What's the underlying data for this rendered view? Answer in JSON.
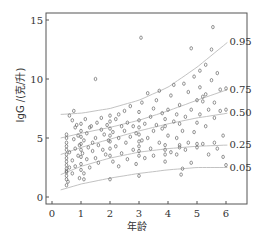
{
  "chart_data": {
    "type": "scatter",
    "title": "",
    "xlabel": "年龄",
    "ylabel": "IgG /(克/升)",
    "xlim": [
      -0.2,
      6.8
    ],
    "ylim": [
      -0.6,
      15.6
    ],
    "x_ticks": [
      0,
      1,
      2,
      3,
      4,
      5,
      6
    ],
    "y_ticks": [
      0,
      5,
      10,
      15
    ],
    "grid": false,
    "legend": null,
    "quantile_curves": [
      {
        "label": "0.95",
        "x": [
          0.3,
          1,
          2,
          3,
          4,
          5,
          6.05
        ],
        "y": [
          7.0,
          7.1,
          7.5,
          8.2,
          9.3,
          11.0,
          13.1
        ]
      },
      {
        "label": "0.75",
        "x": [
          0.3,
          1,
          2,
          3,
          4,
          5,
          6.05
        ],
        "y": [
          5.0,
          5.4,
          5.9,
          6.5,
          7.3,
          8.2,
          9.1
        ]
      },
      {
        "label": "0.50",
        "x": [
          0.3,
          1,
          2,
          3,
          4,
          5,
          6.05
        ],
        "y": [
          3.6,
          4.2,
          4.9,
          5.6,
          6.2,
          6.7,
          7.1
        ]
      },
      {
        "label": "0.25",
        "x": [
          0.3,
          1,
          2,
          3,
          4,
          5,
          6.05
        ],
        "y": [
          1.9,
          2.6,
          3.3,
          3.8,
          4.1,
          4.3,
          4.4
        ]
      },
      {
        "label": "0.05",
        "x": [
          0.3,
          1,
          2,
          3,
          4,
          5,
          6.05
        ],
        "y": [
          0.6,
          1.1,
          1.6,
          2.0,
          2.3,
          2.5,
          2.5
        ]
      }
    ],
    "points": [
      [
        0.5,
        1.0
      ],
      [
        0.5,
        1.5
      ],
      [
        0.5,
        1.8
      ],
      [
        0.5,
        2.1
      ],
      [
        0.5,
        2.4
      ],
      [
        0.5,
        2.7
      ],
      [
        0.5,
        3.0
      ],
      [
        0.5,
        3.3
      ],
      [
        0.5,
        3.6
      ],
      [
        0.5,
        4.0
      ],
      [
        0.5,
        4.3
      ],
      [
        0.5,
        4.6
      ],
      [
        0.5,
        5.0
      ],
      [
        0.5,
        5.3
      ],
      [
        0.5,
        2.2
      ],
      [
        0.55,
        1.3
      ],
      [
        0.6,
        2.5
      ],
      [
        0.6,
        3.8
      ],
      [
        0.6,
        6.9
      ],
      [
        0.7,
        6.5
      ],
      [
        0.7,
        3.1
      ],
      [
        0.7,
        2.0
      ],
      [
        0.75,
        4.9
      ],
      [
        0.75,
        7.3
      ],
      [
        0.8,
        5.9
      ],
      [
        0.8,
        4.1
      ],
      [
        0.8,
        2.6
      ],
      [
        0.85,
        6.1
      ],
      [
        0.9,
        3.5
      ],
      [
        0.9,
        5.2
      ],
      [
        0.95,
        4.4
      ],
      [
        0.95,
        1.6
      ],
      [
        1.0,
        2.3
      ],
      [
        1.0,
        2.8
      ],
      [
        1.0,
        3.4
      ],
      [
        1.0,
        4.0
      ],
      [
        1.0,
        4.5
      ],
      [
        1.0,
        5.1
      ],
      [
        1.0,
        5.6
      ],
      [
        1.0,
        6.2
      ],
      [
        1.05,
        3.7
      ],
      [
        1.1,
        1.5
      ],
      [
        1.1,
        2.0
      ],
      [
        1.1,
        4.8
      ],
      [
        1.15,
        6.6
      ],
      [
        1.2,
        5.4
      ],
      [
        1.2,
        3.2
      ],
      [
        1.25,
        4.2
      ],
      [
        1.3,
        5.9
      ],
      [
        1.3,
        2.5
      ],
      [
        1.35,
        6.0
      ],
      [
        1.4,
        3.9
      ],
      [
        1.4,
        4.6
      ],
      [
        1.5,
        5.0
      ],
      [
        1.5,
        10.0
      ],
      [
        1.5,
        3.3
      ],
      [
        1.55,
        6.3
      ],
      [
        1.6,
        4.4
      ],
      [
        1.6,
        2.9
      ],
      [
        1.7,
        5.7
      ],
      [
        1.7,
        6.7
      ],
      [
        1.75,
        4.0
      ],
      [
        1.8,
        5.3
      ],
      [
        1.85,
        3.6
      ],
      [
        1.9,
        6.1
      ],
      [
        1.95,
        4.8
      ],
      [
        2.0,
        1.5
      ],
      [
        2.0,
        3.5
      ],
      [
        2.0,
        4.1
      ],
      [
        2.0,
        4.7
      ],
      [
        2.0,
        5.2
      ],
      [
        2.0,
        5.8
      ],
      [
        2.0,
        6.4
      ],
      [
        2.0,
        6.9
      ],
      [
        2.1,
        3.0
      ],
      [
        2.1,
        5.5
      ],
      [
        2.2,
        6.6
      ],
      [
        2.2,
        4.3
      ],
      [
        2.3,
        7.0
      ],
      [
        2.3,
        5.0
      ],
      [
        2.3,
        2.6
      ],
      [
        2.4,
        6.0
      ],
      [
        2.4,
        3.7
      ],
      [
        2.5,
        7.3
      ],
      [
        2.5,
        5.6
      ],
      [
        2.55,
        4.6
      ],
      [
        2.6,
        3.2
      ],
      [
        2.6,
        6.3
      ],
      [
        2.7,
        5.1
      ],
      [
        2.7,
        7.7
      ],
      [
        2.8,
        4.0
      ],
      [
        2.8,
        6.0
      ],
      [
        2.9,
        5.4
      ],
      [
        2.9,
        2.8
      ],
      [
        3.0,
        1.8
      ],
      [
        3.0,
        3.5
      ],
      [
        3.0,
        3.9
      ],
      [
        3.0,
        4.3
      ],
      [
        3.0,
        4.7
      ],
      [
        3.0,
        5.3
      ],
      [
        3.0,
        5.9
      ],
      [
        3.0,
        6.5
      ],
      [
        3.0,
        7.2
      ],
      [
        3.07,
        13.5
      ],
      [
        3.1,
        4.8
      ],
      [
        3.1,
        8.0
      ],
      [
        3.2,
        3.3
      ],
      [
        3.2,
        6.2
      ],
      [
        3.3,
        8.8
      ],
      [
        3.3,
        5.0
      ],
      [
        3.4,
        4.1
      ],
      [
        3.4,
        6.8
      ],
      [
        3.5,
        7.5
      ],
      [
        3.5,
        5.6
      ],
      [
        3.5,
        3.5
      ],
      [
        3.6,
        8.2
      ],
      [
        3.6,
        6.1
      ],
      [
        3.7,
        4.6
      ],
      [
        3.7,
        9.0
      ],
      [
        3.8,
        5.8
      ],
      [
        3.8,
        7.1
      ],
      [
        3.9,
        3.0
      ],
      [
        3.9,
        3.6
      ],
      [
        3.9,
        4.0
      ],
      [
        3.9,
        4.4
      ],
      [
        3.9,
        6.0
      ],
      [
        3.9,
        6.6
      ],
      [
        4.0,
        7.4
      ],
      [
        4.0,
        5.2
      ],
      [
        4.1,
        8.6
      ],
      [
        4.1,
        3.8
      ],
      [
        4.2,
        6.4
      ],
      [
        4.2,
        9.5
      ],
      [
        4.3,
        7.0
      ],
      [
        4.3,
        5.0
      ],
      [
        4.3,
        3.6
      ],
      [
        4.4,
        4.2
      ],
      [
        4.4,
        4.4
      ],
      [
        4.4,
        6.2
      ],
      [
        4.4,
        7.8
      ],
      [
        4.45,
        1.9
      ],
      [
        4.5,
        2.4
      ],
      [
        4.5,
        5.6
      ],
      [
        4.55,
        9.6
      ],
      [
        4.6,
        4.0
      ],
      [
        4.6,
        6.8
      ],
      [
        4.7,
        8.9
      ],
      [
        4.7,
        4.6
      ],
      [
        4.8,
        12.6
      ],
      [
        4.8,
        2.9
      ],
      [
        4.8,
        7.4
      ],
      [
        4.9,
        5.5
      ],
      [
        4.9,
        10.2
      ],
      [
        5.0,
        4.2
      ],
      [
        5.0,
        4.5
      ],
      [
        5.0,
        6.3
      ],
      [
        5.0,
        8.2
      ],
      [
        5.1,
        7.0
      ],
      [
        5.1,
        9.3
      ],
      [
        5.1,
        10.7
      ],
      [
        5.2,
        8.5
      ],
      [
        5.2,
        8.1
      ],
      [
        5.2,
        4.5
      ],
      [
        5.3,
        8.7
      ],
      [
        5.3,
        6.0
      ],
      [
        5.3,
        11.2
      ],
      [
        5.4,
        7.4
      ],
      [
        5.4,
        3.6
      ],
      [
        5.5,
        12.5
      ],
      [
        5.5,
        9.9
      ],
      [
        5.55,
        14.4
      ],
      [
        5.6,
        4.6
      ],
      [
        5.6,
        8.0
      ],
      [
        5.6,
        6.7
      ],
      [
        5.7,
        10.5
      ],
      [
        5.7,
        4.1
      ],
      [
        5.8,
        9.1
      ],
      [
        5.8,
        7.3
      ],
      [
        5.9,
        3.4
      ],
      [
        5.9,
        5.2
      ],
      [
        6.0,
        7.4
      ],
      [
        6.0,
        9.2
      ],
      [
        6.0,
        2.7
      ]
    ]
  },
  "axes": {
    "x_tick_labels": [
      "0",
      "1",
      "2",
      "3",
      "4",
      "5",
      "6"
    ],
    "y_tick_labels": [
      "0",
      "5",
      "10",
      "15"
    ],
    "x_title": "年龄",
    "y_title": "IgG /(克/升)"
  },
  "curve_labels": [
    "0.95",
    "0.75",
    "0.50",
    "0.25",
    "0.05"
  ]
}
